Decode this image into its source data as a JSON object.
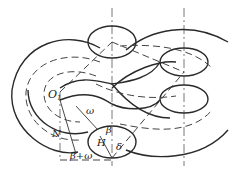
{
  "diagram": {
    "type": "engineering-geometry",
    "labels": {
      "O1": "O",
      "O1_sub": "1",
      "omega": "ω",
      "N": "N",
      "beta_plus_omega": "β+ω",
      "beta": "β",
      "H": "H",
      "delta": "δ"
    },
    "colors": {
      "line": "#2a2a2a",
      "dash": "#444444",
      "background": "#ffffff"
    }
  }
}
